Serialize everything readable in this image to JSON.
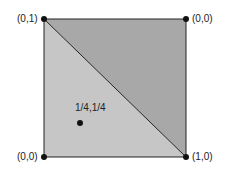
{
  "diagram": {
    "square": {
      "x0": 44,
      "y0": 19,
      "x1": 186,
      "y1": 157
    },
    "colors": {
      "upper_triangle": "#a8a8a8",
      "lower_triangle": "#c6c6c6",
      "stroke": "#222222",
      "point": "#111111"
    },
    "corners": {
      "top_left": "(0,1)",
      "top_right": "(0,0)",
      "bottom_left": "(0,0)",
      "bottom_right": "(1,0)"
    },
    "interior_point": {
      "label": "1/4,1/4",
      "x": 80,
      "y": 123
    }
  }
}
